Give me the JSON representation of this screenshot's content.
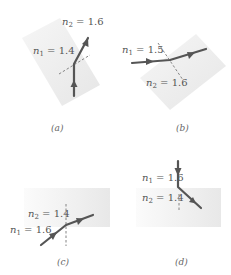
{
  "figure": {
    "panels": [
      {
        "id": "a",
        "caption": "(a)",
        "n1_label": "n",
        "n1_sub": "1",
        "n1_value": " = 1.4",
        "n2_label": "n",
        "n2_sub": "2",
        "n2_value": " = 1.6"
      },
      {
        "id": "b",
        "caption": "(b)",
        "n1_label": "n",
        "n1_sub": "1",
        "n1_value": " = 1.5",
        "n2_label": "n",
        "n2_sub": "2",
        "n2_value": " = 1.6"
      },
      {
        "id": "c",
        "caption": "(c)",
        "n1_label": "n",
        "n1_sub": "1",
        "n1_value": " = 1.6",
        "n2_label": "n",
        "n2_sub": "2",
        "n2_value": " = 1.4"
      },
      {
        "id": "d",
        "caption": "(d)",
        "n1_label": "n",
        "n1_sub": "1",
        "n1_value": " = 1.6",
        "n2_label": "n",
        "n2_sub": "2",
        "n2_value": " = 1.4"
      }
    ],
    "colors": {
      "ray": "#555555",
      "medium_shade": "#ececec",
      "interface": "#777777",
      "background": "#ffffff"
    }
  }
}
